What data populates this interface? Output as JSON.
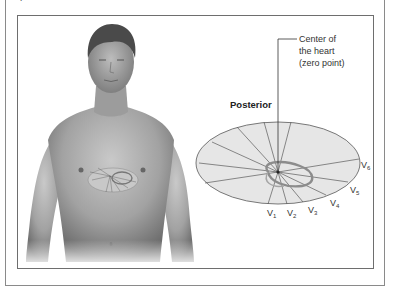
{
  "figure": {
    "caption_cut": "placement of the chest leads...",
    "labels": {
      "center_line1": "Center of",
      "center_line2": "the heart",
      "center_line3": "(zero point)",
      "posterior": "Posterior"
    },
    "leads": [
      {
        "name": "V",
        "sub": "1"
      },
      {
        "name": "V",
        "sub": "2"
      },
      {
        "name": "V",
        "sub": "3"
      },
      {
        "name": "V",
        "sub": "4"
      },
      {
        "name": "V",
        "sub": "5"
      },
      {
        "name": "V",
        "sub": "6"
      }
    ],
    "colors": {
      "frame": "#8a8a8a",
      "ellipse_fill": "#e6e6e6",
      "ellipse_stroke": "#6a6a6a",
      "skin": "#9a9a9a",
      "hair": "#4a4a4a"
    }
  }
}
